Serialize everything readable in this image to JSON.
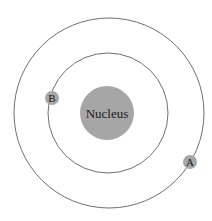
{
  "diagram": {
    "type": "atom-orbit-model",
    "nucleus": {
      "label": "Nucleus",
      "color": "#a6a6a6"
    },
    "orbits": [
      {
        "name": "inner-orbit"
      },
      {
        "name": "outer-orbit"
      }
    ],
    "particles": [
      {
        "label": "A",
        "orbit": "outer-orbit",
        "color": "#a6a6a6"
      },
      {
        "label": "B",
        "orbit": "inner-orbit",
        "color": "#a6a6a6"
      }
    ],
    "line_color": "#6e6e6e"
  }
}
